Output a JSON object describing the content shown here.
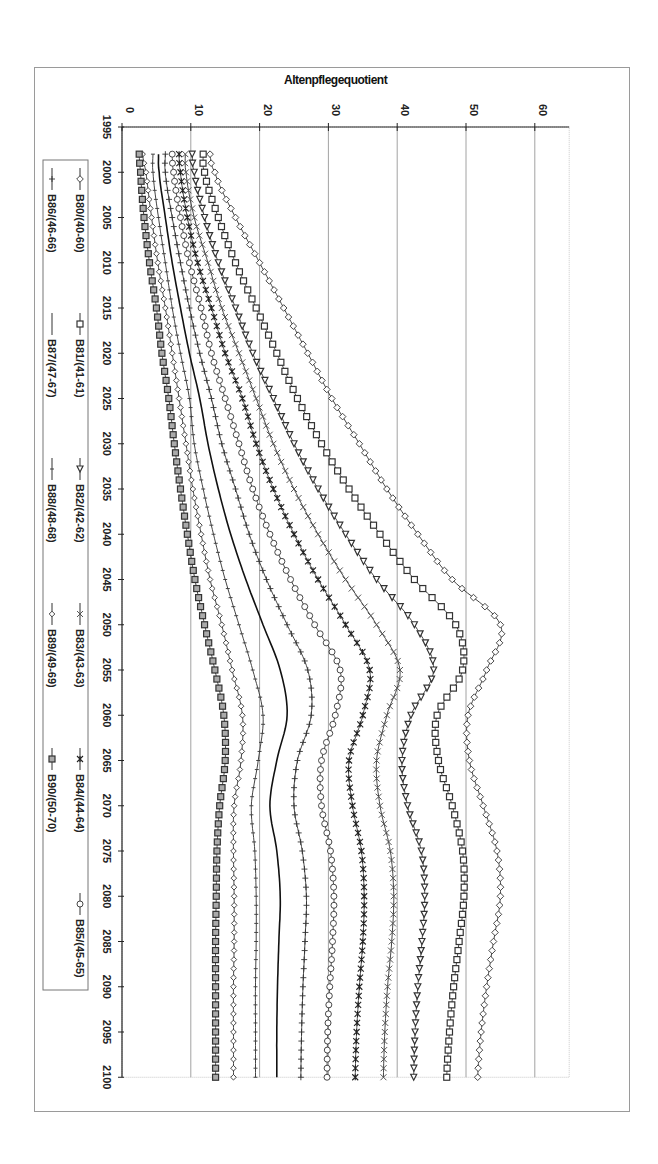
{
  "chart_data": {
    "type": "line",
    "orientation": "rotated-90-clockwise",
    "title": "",
    "ylabel": "Altenpflegequotient",
    "xlabel": "",
    "x_ticks": [
      1995,
      2000,
      2005,
      2010,
      2015,
      2020,
      2025,
      2030,
      2035,
      2040,
      2045,
      2050,
      2055,
      2060,
      2065,
      2070,
      2075,
      2080,
      2085,
      2090,
      2095,
      2100
    ],
    "y_ticks": [
      0,
      10,
      20,
      30,
      40,
      50,
      60
    ],
    "xlim": [
      1995,
      2100
    ],
    "ylim": [
      0,
      65
    ],
    "grid": "vertical value gridlines",
    "legend_position": "left (rotated), boxed",
    "x": [
      1998,
      2000,
      2005,
      2010,
      2015,
      2020,
      2025,
      2030,
      2035,
      2040,
      2045,
      2050,
      2055,
      2060,
      2065,
      2070,
      2075,
      2080,
      2085,
      2090,
      2095,
      2100
    ],
    "series": [
      {
        "name": "B80/(40-60)",
        "marker": "diamond",
        "values": [
          12.8,
          13.5,
          16.5,
          20.0,
          23.5,
          27.0,
          30.5,
          34.5,
          38.5,
          43.0,
          48.0,
          55.0,
          53.0,
          50.3,
          50.5,
          52.5,
          54.5,
          55.0,
          54.0,
          53.0,
          52.2,
          51.7
        ]
      },
      {
        "name": "B81/(41-61)",
        "marker": "square",
        "values": [
          11.8,
          12.0,
          14.0,
          16.5,
          19.5,
          22.5,
          25.5,
          29.0,
          33.0,
          37.5,
          42.5,
          48.5,
          49.5,
          45.8,
          46.0,
          48.0,
          49.5,
          49.7,
          49.0,
          48.2,
          47.6,
          47.2
        ]
      },
      {
        "name": "B82/(42-62)",
        "marker": "triangle",
        "values": [
          10.2,
          10.5,
          12.0,
          14.0,
          16.5,
          19.0,
          22.0,
          25.0,
          28.5,
          32.5,
          37.0,
          42.5,
          45.3,
          42.0,
          40.7,
          41.5,
          43.5,
          44.0,
          43.6,
          43.0,
          42.6,
          42.4
        ]
      },
      {
        "name": "B83/(43-63)",
        "marker": "x",
        "values": [
          9.2,
          9.3,
          10.5,
          12.5,
          14.5,
          17.0,
          19.5,
          22.0,
          25.0,
          28.5,
          32.5,
          37.0,
          40.4,
          38.5,
          37.0,
          37.5,
          39.0,
          39.5,
          39.2,
          38.6,
          38.2,
          38.0
        ]
      },
      {
        "name": "B84/(44-64)",
        "marker": "star",
        "values": [
          8.3,
          8.5,
          9.5,
          11.0,
          13.0,
          15.0,
          17.5,
          19.5,
          22.0,
          25.0,
          28.5,
          32.5,
          36.0,
          35.0,
          33.0,
          33.5,
          34.8,
          35.2,
          35.0,
          34.5,
          34.1,
          33.9
        ]
      },
      {
        "name": "B85/(45-65)",
        "marker": "circle",
        "values": [
          7.3,
          7.5,
          8.5,
          9.8,
          11.5,
          13.0,
          15.0,
          17.0,
          19.0,
          21.5,
          24.5,
          28.0,
          31.7,
          31.0,
          29.0,
          29.0,
          30.3,
          30.8,
          30.6,
          30.2,
          29.9,
          29.8
        ]
      },
      {
        "name": "B86/(46-66)",
        "marker": "plus",
        "values": [
          6.3,
          6.3,
          7.3,
          8.5,
          9.8,
          11.3,
          13.0,
          14.5,
          16.5,
          18.5,
          21.0,
          24.0,
          27.0,
          27.5,
          25.5,
          25.0,
          26.2,
          26.8,
          26.6,
          26.3,
          26.1,
          26.0
        ]
      },
      {
        "name": "B87/(47-67)",
        "marker": "none",
        "values": [
          5.3,
          5.4,
          6.3,
          7.3,
          8.5,
          9.8,
          11.3,
          12.5,
          14.0,
          15.8,
          18.0,
          20.5,
          23.0,
          24.0,
          22.5,
          21.5,
          22.5,
          23.0,
          22.8,
          22.6,
          22.5,
          22.5
        ]
      },
      {
        "name": "B88/(48-68)",
        "marker": "dash",
        "values": [
          4.5,
          4.5,
          5.3,
          6.3,
          7.3,
          8.5,
          9.8,
          10.5,
          11.8,
          13.3,
          15.0,
          17.0,
          19.0,
          20.5,
          19.8,
          18.8,
          19.3,
          19.5,
          19.5,
          19.4,
          19.4,
          19.4
        ]
      },
      {
        "name": "B89/(49-69)",
        "marker": "diamond-small",
        "values": [
          3.0,
          3.5,
          4.3,
          5.2,
          6.3,
          7.3,
          8.3,
          9.3,
          10.3,
          11.5,
          12.8,
          14.5,
          16.0,
          17.5,
          17.3,
          16.3,
          16.2,
          16.3,
          16.3,
          16.2,
          16.2,
          16.2
        ]
      },
      {
        "name": "B90/(50-70)",
        "marker": "square-filled",
        "values": [
          2.5,
          2.7,
          3.2,
          4.0,
          5.0,
          5.8,
          6.8,
          7.6,
          8.5,
          9.5,
          10.6,
          12.0,
          13.5,
          14.8,
          15.0,
          14.2,
          13.8,
          13.7,
          13.6,
          13.6,
          13.6,
          13.6
        ]
      }
    ]
  }
}
